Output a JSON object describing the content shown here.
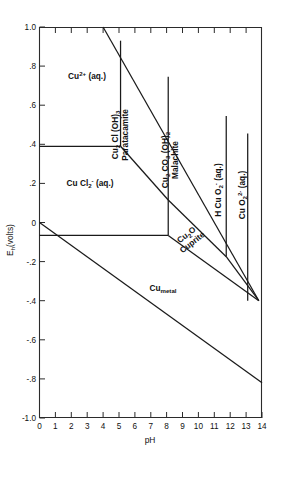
{
  "figure": {
    "type": "pourbaix-diagram",
    "title": ""
  },
  "chart_data": {
    "type": "line",
    "title": "",
    "xlabel": "pH",
    "ylabel": "E_h (volts)",
    "xlim": [
      0,
      14
    ],
    "ylim": [
      -1.0,
      1.0
    ],
    "grid": false,
    "legend": "none",
    "x_ticks": [
      0,
      1,
      2,
      3,
      4,
      5,
      6,
      7,
      8,
      9,
      10,
      11,
      12,
      13,
      14
    ],
    "x_tick_labels": [
      "0",
      "1",
      "2",
      "3",
      "4",
      "5",
      "6",
      "7",
      "8",
      "9",
      "10",
      "11",
      "12",
      "13",
      "14"
    ],
    "y_ticks": [
      -1.0,
      -0.8,
      -0.6,
      -0.4,
      -0.2,
      0,
      0.2,
      0.4,
      0.6,
      0.8,
      1.0
    ],
    "y_tick_labels": [
      "-1.0",
      "-.8",
      "-.6",
      "-.4",
      "-.2",
      "0",
      ".2",
      ".4",
      ".6",
      ".8",
      "1.0"
    ],
    "series": [
      {
        "name": "Cu2+ / Paratacamite boundary (upper diagonal)",
        "points": [
          [
            4.0,
            1.0
          ],
          [
            13.8,
            -0.4
          ]
        ]
      },
      {
        "name": "Cu2+ / CuCl2- horizontal boundary",
        "points": [
          [
            0.0,
            0.39
          ],
          [
            5.1,
            0.39
          ]
        ]
      },
      {
        "name": "Cu2+ / Paratacamite vertical boundary",
        "points": [
          [
            5.1,
            0.93
          ],
          [
            5.1,
            0.39
          ]
        ]
      },
      {
        "name": "CuCl2- / Paratacamite lower diagonal",
        "points": [
          [
            5.1,
            0.39
          ],
          [
            8.1,
            0.115
          ]
        ]
      },
      {
        "name": "Paratacamite / Malachite vertical boundary",
        "points": [
          [
            8.1,
            0.745
          ],
          [
            8.1,
            0.115
          ]
        ]
      },
      {
        "name": "CuCl2- / Cu2O vertical boundary",
        "points": [
          [
            8.1,
            0.115
          ],
          [
            8.1,
            -0.066
          ]
        ]
      },
      {
        "name": "Malachite / Cu2O diagonal boundary",
        "points": [
          [
            8.1,
            0.115
          ],
          [
            11.75,
            -0.175
          ]
        ]
      },
      {
        "name": "Cu2O / HCuO2- diagonal boundary",
        "points": [
          [
            11.75,
            -0.175
          ],
          [
            13.8,
            -0.4
          ]
        ]
      },
      {
        "name": "Malachite / HCuO2- vertical boundary",
        "points": [
          [
            11.75,
            0.545
          ],
          [
            11.75,
            -0.175
          ]
        ]
      },
      {
        "name": "HCuO2- / CuO2 2- vertical boundary",
        "points": [
          [
            13.1,
            0.455
          ],
          [
            13.1,
            -0.4
          ]
        ]
      },
      {
        "name": "Cu metal / Cu2O horizontal boundary",
        "points": [
          [
            0.0,
            -0.066
          ],
          [
            8.1,
            -0.066
          ]
        ]
      },
      {
        "name": "Cu metal / Cu2O diagonal boundary",
        "points": [
          [
            8.1,
            -0.066
          ],
          [
            13.8,
            -0.4
          ]
        ]
      },
      {
        "name": "Water stability lower limit",
        "points": [
          [
            0.0,
            0.0
          ],
          [
            14.0,
            -0.82
          ]
        ]
      }
    ]
  },
  "axes": {
    "x": {
      "title": "pH",
      "min": 0,
      "max": 14,
      "tick_labels": [
        "0",
        "1",
        "2",
        "3",
        "4",
        "5",
        "6",
        "7",
        "8",
        "9",
        "10",
        "11",
        "12",
        "13",
        "14"
      ]
    },
    "y": {
      "title_main": "E",
      "title_sub": "h",
      "title_unit": "(volts)",
      "min": -1.0,
      "max": 1.0,
      "tick_labels": [
        "1.0",
        ".8",
        ".6",
        ".4",
        ".2",
        "0",
        "-.2",
        "-.4",
        "-.6",
        "-.8",
        "-1.0"
      ]
    }
  },
  "fields": [
    {
      "id": "cu2plus-aq",
      "name": "Cu2+ aqueous field",
      "line1_pre": "Cu",
      "line1_sup": "2+",
      "line1_post": " (aq.)",
      "line2": "",
      "rotation": 0
    },
    {
      "id": "cucl2-minus-aq",
      "name": "CuCl2- aqueous field",
      "line1_pre": "Cu Cl",
      "line1_sub": "2",
      "line1_sup": "-",
      "line1_post": " (aq.)",
      "line2": "",
      "rotation": 0
    },
    {
      "id": "paratacamite",
      "name": "Paratacamite field",
      "formula_parts": [
        "Cu",
        "2",
        " Cl (OH)",
        "3"
      ],
      "mineral": "Paratacamite",
      "rotation": -90
    },
    {
      "id": "malachite",
      "name": "Malachite field",
      "formula_parts": [
        "Cu",
        "2",
        " CO",
        "3",
        " (OH)",
        "2"
      ],
      "mineral": "Malachite",
      "rotation": -90
    },
    {
      "id": "hcuo2-minus-aq",
      "name": "HCuO2- aqueous field",
      "formula": "H Cu O",
      "sub": "2",
      "sup": "-",
      "post": " (aq.)",
      "rotation": -90
    },
    {
      "id": "cuo2-2minus-aq",
      "name": "CuO2 2- aqueous field",
      "formula": "Cu O",
      "sub": "2",
      "sup": "2-",
      "post": " (aq.)",
      "rotation": -90
    },
    {
      "id": "cuprite",
      "name": "Cuprite field",
      "formula_pre": "Cu",
      "formula_sub": "2",
      "formula_post": "O",
      "mineral": "Cuprite",
      "rotation": -38
    },
    {
      "id": "cu-metal",
      "name": "Copper metal field",
      "formula_pre": "Cu",
      "formula_sub": "metal",
      "rotation": 0
    }
  ]
}
